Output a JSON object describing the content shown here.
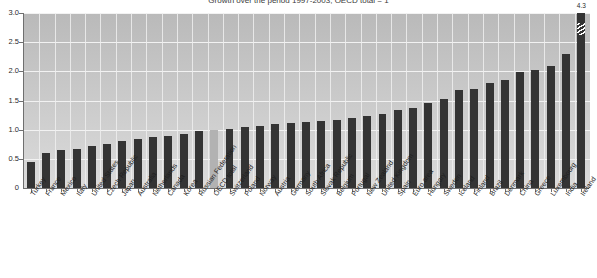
{
  "chart_data": {
    "type": "bar",
    "title": "Growth over the period 1997-2003, OECD total = 1",
    "xlabel": "",
    "ylabel": "",
    "ylim": [
      0,
      3.0
    ],
    "ytick_labels": [
      "0",
      "0.5",
      "1.0",
      "1.5",
      "2.0",
      "2.5",
      "3.0"
    ],
    "ytick_values": [
      0,
      0.5,
      1.0,
      1.5,
      2.0,
      2.5,
      3.0
    ],
    "grid": true,
    "legend": "none",
    "highlight_category": "OECD total",
    "highlight_color": "#b2b2b2",
    "bar_color": "#343434",
    "plot_background": "#c9c9c9",
    "categories": [
      "Turkey",
      "France",
      "Mexico",
      "Italy",
      "United States",
      "Czech Republic",
      "Japan",
      "Australia",
      "Netherlands",
      "Canada",
      "Korea",
      "Russian Federation",
      "OECD total",
      "Switzerland",
      "Poland",
      "Norway",
      "Austria",
      "Germany",
      "South Africa",
      "Slovak Republic",
      "Belgium",
      "Portugal",
      "New Zealand",
      "United Kingdom",
      "Spain",
      "Euro area",
      "Hungary",
      "Sweden",
      "Iceland",
      "Finland",
      "Brazil",
      "Denmark",
      "China",
      "Greece",
      "Luxembourg",
      "India",
      "Ireland"
    ],
    "values": [
      0.45,
      0.6,
      0.65,
      0.67,
      0.72,
      0.76,
      0.8,
      0.84,
      0.88,
      0.9,
      0.93,
      0.97,
      1.0,
      1.02,
      1.05,
      1.07,
      1.09,
      1.11,
      1.13,
      1.15,
      1.17,
      1.2,
      1.24,
      1.27,
      1.33,
      1.38,
      1.45,
      1.52,
      1.68,
      1.7,
      1.8,
      1.86,
      1.99,
      2.03,
      2.1,
      2.3,
      4.3
    ],
    "annotations": [
      {
        "category": "Ireland",
        "label": "4.3",
        "note": "bar truncated with broken-axis slash"
      }
    ]
  },
  "footer": {
    "text": ""
  }
}
